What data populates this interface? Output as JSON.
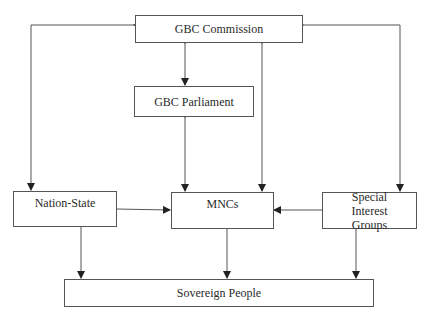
{
  "diagram": {
    "type": "flowchart",
    "nodes": [
      {
        "id": "commission",
        "label": "GBC Commission"
      },
      {
        "id": "parliament",
        "label": "GBC Parliament"
      },
      {
        "id": "nation_state",
        "label": "Nation-State"
      },
      {
        "id": "mncs",
        "label": "MNCs"
      },
      {
        "id": "special_interest",
        "label": "Special Interest Groups"
      },
      {
        "id": "sovereign",
        "label": "Sovereign People"
      }
    ],
    "edges": [
      {
        "from": "commission",
        "to": "parliament",
        "direction": "both"
      },
      {
        "from": "parliament",
        "to": "mncs",
        "direction": "both"
      },
      {
        "from": "commission",
        "to": "mncs",
        "direction": "both"
      },
      {
        "from": "commission",
        "to": "nation_state",
        "direction": "both"
      },
      {
        "from": "commission",
        "to": "special_interest",
        "direction": "both"
      },
      {
        "from": "nation_state",
        "to": "mncs",
        "direction": "forward"
      },
      {
        "from": "special_interest",
        "to": "mncs",
        "direction": "forward"
      },
      {
        "from": "nation_state",
        "to": "sovereign",
        "direction": "forward"
      },
      {
        "from": "mncs",
        "to": "sovereign",
        "direction": "forward"
      },
      {
        "from": "special_interest",
        "to": "sovereign",
        "direction": "forward"
      }
    ]
  },
  "labels": {
    "commission": "GBC Commission",
    "parliament": "GBC Parliament",
    "nation_state": "Nation-State",
    "mncs": "MNCs",
    "special_interest": "Special Interest Groups",
    "sovereign": "Sovereign People"
  }
}
